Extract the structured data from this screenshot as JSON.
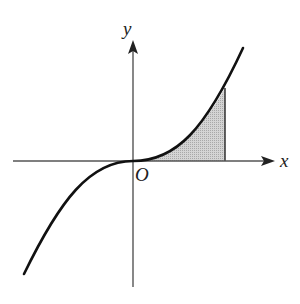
{
  "diagram": {
    "type": "function-graph",
    "labels": {
      "x_axis": "x",
      "y_axis": "y",
      "origin": "O"
    },
    "colors": {
      "axis": "#555555",
      "curve": "#111111",
      "shade": "#c8c8c8"
    }
  }
}
